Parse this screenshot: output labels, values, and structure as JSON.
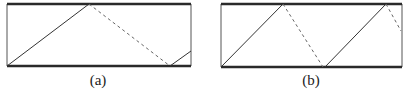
{
  "colors": {
    "background": "#ffffff",
    "thick_edge": "#2a2a2a",
    "side_edge": "#555555",
    "solid_ray": "#333333",
    "dashed_ray": "#666666"
  },
  "panels": [
    {
      "id": "a",
      "caption": "(a)",
      "caption_x": 98,
      "caption_y": 73,
      "box": {
        "x1": 7,
        "y1": 4,
        "x2": 191,
        "y2": 66
      },
      "segments": [
        {
          "type": "solid",
          "x1": 7,
          "y1": 66,
          "x2": 89,
          "y2": 4
        },
        {
          "type": "dashed",
          "x1": 89,
          "y1": 4,
          "x2": 170,
          "y2": 66
        },
        {
          "type": "solid",
          "x1": 170,
          "y1": 66,
          "x2": 191,
          "y2": 51
        }
      ]
    },
    {
      "id": "b",
      "caption": "(b)",
      "caption_x": 311,
      "caption_y": 73,
      "box": {
        "x1": 221,
        "y1": 4,
        "x2": 402,
        "y2": 67
      },
      "segments": [
        {
          "type": "solid",
          "x1": 221,
          "y1": 67,
          "x2": 283,
          "y2": 4
        },
        {
          "type": "dashed",
          "x1": 283,
          "y1": 4,
          "x2": 323,
          "y2": 67
        },
        {
          "type": "solid",
          "x1": 325,
          "y1": 67,
          "x2": 386,
          "y2": 4
        },
        {
          "type": "dashed",
          "x1": 386,
          "y1": 4,
          "x2": 401,
          "y2": 31
        }
      ]
    }
  ]
}
